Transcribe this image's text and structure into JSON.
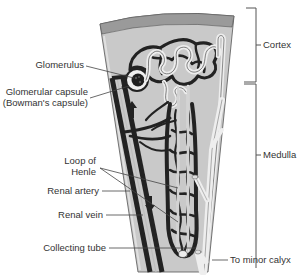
{
  "diagram": {
    "colors": {
      "background": "#ffffff",
      "tissue": "#c9c9c9",
      "surface_band": "#9a9a9a",
      "vessel": "#2a2a2a",
      "tubule": "#e6e6e6",
      "leader_line": "#444444",
      "text": "#333333"
    },
    "left_labels": {
      "glomerulus": "Glomerulus",
      "capsule_line1": "Glomerular capsule",
      "capsule_line2": "(Bowman's capsule)",
      "loop_line1": "Loop of",
      "loop_line2": "Henle",
      "renal_artery": "Renal artery",
      "renal_vein": "Renal vein",
      "collecting_tube": "Collecting tube"
    },
    "right_labels": {
      "cortex": "Cortex",
      "medulla": "Medulla",
      "minor_calyx": "To minor calyx"
    },
    "arrows": [
      {
        "name": "flow-up-arrow",
        "direction": "up"
      },
      {
        "name": "flow-down-arrow",
        "direction": "down"
      }
    ]
  }
}
